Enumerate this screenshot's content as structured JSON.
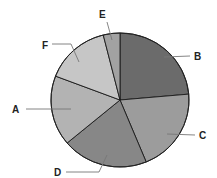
{
  "chart_data": {
    "type": "pie",
    "title": "",
    "start_angle_deg": 0,
    "direction": "clockwise",
    "slices": [
      {
        "label": "B",
        "value": 23.6,
        "color": "#6b6b6b"
      },
      {
        "label": "C",
        "value": 20.2,
        "color": "#9c9c9c"
      },
      {
        "label": "D",
        "value": 20.1,
        "color": "#878787"
      },
      {
        "label": "A",
        "value": 16.9,
        "color": "#b3b3b3"
      },
      {
        "label": "F",
        "value": 15.3,
        "color": "#c6c6c6"
      },
      {
        "label": "E",
        "value": 3.9,
        "color": "#a2a2a2"
      }
    ],
    "categories": [
      "B",
      "C",
      "D",
      "A",
      "F",
      "E"
    ],
    "values": [
      23.6,
      20.2,
      20.1,
      16.9,
      15.3,
      3.9
    ],
    "legend": "none (callout labels with leader lines)",
    "grid": false
  },
  "layout": {
    "center": [
      120,
      100
    ],
    "rx": 69,
    "ry": 67,
    "labels": {
      "B": {
        "text": "B",
        "x": 194,
        "y": 60,
        "leader": [
          [
            190,
            56
          ],
          [
            164,
            57
          ]
        ]
      },
      "C": {
        "text": "C",
        "x": 199,
        "y": 139,
        "leader": [
          [
            195,
            135
          ],
          [
            167,
            134
          ]
        ]
      },
      "D": {
        "text": "D",
        "x": 54,
        "y": 176,
        "leader": [
          [
            66,
            172
          ],
          [
            99,
            172
          ],
          [
            107,
            155
          ]
        ]
      },
      "A": {
        "text": "A",
        "x": 12,
        "y": 113,
        "leader": [
          [
            26,
            109
          ],
          [
            71,
            109
          ]
        ]
      },
      "F": {
        "text": "F",
        "x": 42,
        "y": 49,
        "leader": [
          [
            52,
            44
          ],
          [
            71,
            44
          ],
          [
            79,
            62
          ]
        ]
      },
      "E": {
        "text": "E",
        "x": 99,
        "y": 18,
        "leader": [
          [
            107,
            22
          ],
          [
            112,
            40
          ]
        ]
      }
    }
  }
}
